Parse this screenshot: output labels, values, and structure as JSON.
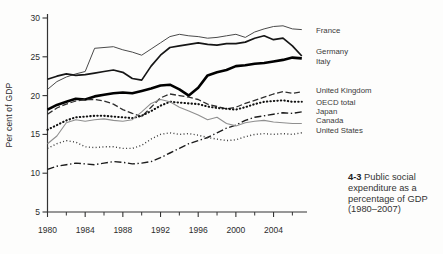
{
  "figure": {
    "caption": {
      "number": "4-3",
      "text": "Public social expenditure as a percentage of GDP (1980–2007)"
    }
  },
  "chart_data": {
    "type": "line",
    "title": "",
    "xlabel": "",
    "ylabel": "Per cent of GDP",
    "ylim": [
      5,
      30
    ],
    "xlim": [
      1980,
      2007
    ],
    "grid": false,
    "legend_position": "right-of-line-ends",
    "yticks": [
      5,
      10,
      15,
      20,
      25,
      30
    ],
    "xticks_labeled": [
      1980,
      1984,
      1988,
      1992,
      1996,
      2000,
      2004
    ],
    "xticks_minor": [
      1982,
      1986,
      1990,
      1994,
      1998,
      2002,
      2006
    ],
    "x": [
      1980,
      1981,
      1982,
      1983,
      1984,
      1985,
      1986,
      1987,
      1988,
      1989,
      1990,
      1991,
      1992,
      1993,
      1994,
      1995,
      1996,
      1997,
      1998,
      1999,
      2000,
      2001,
      2002,
      2003,
      2004,
      2005,
      2006,
      2007
    ],
    "series": [
      {
        "name": "France",
        "color": "#4a4a4a",
        "width": 1.0,
        "dash": "",
        "label_y": 31,
        "values": [
          20.8,
          21.8,
          22.4,
          22.8,
          23.1,
          26.1,
          26.2,
          26.3,
          25.9,
          25.6,
          25.2,
          26.0,
          26.8,
          27.6,
          27.9,
          27.7,
          27.6,
          27.4,
          27.5,
          27.7,
          27.9,
          27.5,
          28.2,
          28.6,
          28.9,
          29.0,
          28.6,
          28.5
        ]
      },
      {
        "name": "Germany",
        "color": "#161616",
        "width": 1.7,
        "dash": "",
        "label_y": 52,
        "values": [
          22.1,
          22.5,
          22.8,
          22.6,
          22.7,
          22.9,
          23.1,
          23.3,
          23.0,
          22.2,
          22.0,
          23.8,
          25.2,
          26.2,
          26.4,
          26.6,
          26.8,
          26.6,
          26.5,
          26.7,
          26.7,
          26.9,
          27.4,
          27.7,
          27.2,
          27.4,
          26.4,
          25.1
        ]
      },
      {
        "name": "Italy",
        "color": "#000000",
        "width": 2.6,
        "dash": "",
        "label_y": 62,
        "values": [
          18.2,
          18.8,
          19.2,
          19.6,
          19.5,
          19.9,
          20.1,
          20.3,
          20.4,
          20.3,
          20.6,
          20.9,
          21.3,
          21.4,
          20.8,
          20.0,
          21.0,
          22.6,
          23.0,
          23.3,
          23.8,
          23.9,
          24.1,
          24.2,
          24.4,
          24.6,
          24.9,
          24.8
        ]
      },
      {
        "name": "United Kingdom",
        "color": "#2e2e2e",
        "width": 1.3,
        "dash": "6 2.6",
        "label_y": 91,
        "values": [
          17.6,
          18.4,
          18.9,
          19.3,
          19.5,
          19.5,
          19.3,
          18.9,
          18.2,
          17.7,
          17.3,
          18.5,
          19.7,
          20.2,
          20.0,
          19.8,
          19.5,
          18.9,
          18.6,
          18.3,
          18.5,
          19.0,
          19.4,
          19.8,
          20.2,
          20.5,
          20.3,
          20.5
        ]
      },
      {
        "name": "OECD total",
        "color": "#111111",
        "width": 2.1,
        "dash": "0.4 3.1",
        "label_y": 103,
        "values": [
          15.6,
          16.2,
          16.8,
          17.2,
          17.3,
          17.4,
          17.4,
          17.3,
          17.2,
          17.1,
          17.4,
          18.0,
          18.7,
          19.2,
          19.1,
          19.0,
          18.9,
          18.6,
          18.4,
          18.3,
          18.2,
          18.5,
          18.9,
          19.2,
          19.3,
          19.4,
          19.2,
          19.2
        ]
      },
      {
        "name": "Japan",
        "color": "#1c1c1c",
        "width": 1.4,
        "dash": "7 2.6 1.4 2.6",
        "label_y": 112,
        "values": [
          10.5,
          10.9,
          11.1,
          11.3,
          11.2,
          11.1,
          11.3,
          11.5,
          11.4,
          11.2,
          11.3,
          11.5,
          12.0,
          12.6,
          13.2,
          13.8,
          14.2,
          14.6,
          15.2,
          15.8,
          16.2,
          16.8,
          17.2,
          17.4,
          17.6,
          17.8,
          17.7,
          17.9
        ]
      },
      {
        "name": "Canada",
        "color": "#8f8f8f",
        "width": 1.1,
        "dash": "",
        "label_y": 121,
        "values": [
          13.8,
          14.8,
          16.5,
          16.9,
          16.7,
          16.9,
          17.0,
          16.8,
          16.7,
          16.9,
          17.9,
          19.0,
          19.5,
          19.2,
          18.5,
          18.0,
          17.5,
          16.9,
          17.2,
          16.4,
          16.1,
          16.5,
          16.7,
          16.8,
          16.6,
          16.5,
          16.4,
          16.4
        ]
      },
      {
        "name": "United States",
        "color": "#3a3a3a",
        "width": 1.4,
        "dash": "1 2.4",
        "label_y": 131,
        "values": [
          13.2,
          13.8,
          14.2,
          14.0,
          13.4,
          13.3,
          13.4,
          13.4,
          13.2,
          13.2,
          13.6,
          14.4,
          15.0,
          15.2,
          15.0,
          15.1,
          14.9,
          14.6,
          14.4,
          14.2,
          14.3,
          14.7,
          15.0,
          15.1,
          15.0,
          15.1,
          15.0,
          15.2
        ]
      }
    ]
  }
}
